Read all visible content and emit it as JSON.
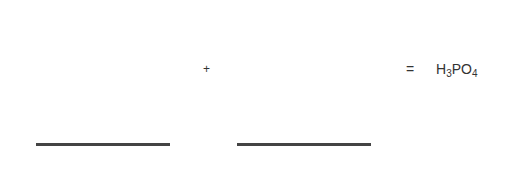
{
  "equation": {
    "operator_plus": "+",
    "operator_equals": "=",
    "product": {
      "parts": [
        {
          "text": "H",
          "sub": "3"
        },
        {
          "text": "PO",
          "sub": "4"
        }
      ]
    },
    "blanks": [
      {
        "label": "reactant-1 blank",
        "value": ""
      },
      {
        "label": "reactant-2 blank",
        "value": ""
      }
    ]
  },
  "colors": {
    "line": "#444444",
    "text": "#333333",
    "background": "#ffffff"
  }
}
